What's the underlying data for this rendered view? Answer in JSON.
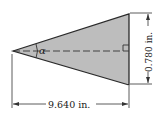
{
  "diagram": {
    "angle_label": "α",
    "height_label": "0.780 in.",
    "length_label": "9.640 in.",
    "colors": {
      "fill": "#bdbdbd",
      "stroke": "#2a2a2a",
      "background": "#ffffff"
    }
  }
}
